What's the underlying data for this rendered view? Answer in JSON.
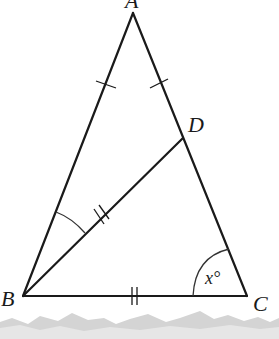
{
  "figure": {
    "type": "geometry",
    "vertices": {
      "A": {
        "label": "A",
        "x": 133,
        "y": 13
      },
      "B": {
        "label": "B",
        "x": 23,
        "y": 296
      },
      "C": {
        "label": "C",
        "x": 247,
        "y": 296
      },
      "D": {
        "label": "D",
        "x": 183,
        "y": 138
      }
    },
    "segments": [
      "AB",
      "AC",
      "BC",
      "BD"
    ],
    "equal_marks": [
      {
        "segments": [
          "AB",
          "AC"
        ],
        "ticks": 1
      },
      {
        "segments": [
          "BD",
          "BC"
        ],
        "ticks": 2
      }
    ],
    "angle_marks": [
      {
        "vertex": "B",
        "between": [
          "A",
          "D"
        ],
        "style": "arc"
      },
      {
        "vertex": "C",
        "between": [
          "B",
          "A"
        ],
        "style": "arc",
        "label": "x°"
      }
    ],
    "labels": {
      "a": "A",
      "b": "B",
      "c": "C",
      "d": "D",
      "angle_c": "x°"
    }
  },
  "colors": {
    "ink": "#1a1a1a",
    "background": "#ffffff",
    "torn_edge": "#c8c8c8"
  }
}
